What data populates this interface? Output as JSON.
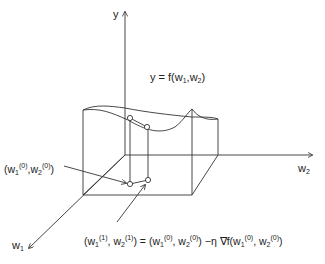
{
  "diagram": {
    "axes": {
      "y": {
        "label": "y"
      },
      "w2": {
        "label": "w",
        "sub": "2"
      },
      "w1": {
        "label": "w",
        "sub": "1"
      }
    },
    "surface_label": {
      "prefix": "y = f(w",
      "sub1": "1",
      "mid": ",w",
      "sub2": "2",
      "suffix": ")"
    },
    "start_point_label": {
      "open": "(w",
      "sub1": "1",
      "sup1": "(0)",
      "mid": ",w",
      "sub2": "2",
      "sup2": "(0)",
      "close": ")"
    },
    "update_rule": {
      "lhs_open": "(w",
      "lhs_sub1": "1",
      "lhs_sup1": "(1)",
      "lhs_mid": ", w",
      "lhs_sub2": "2",
      "lhs_sup2": "(1)",
      "eq": ") = (w",
      "r_sub1": "1",
      "r_sup1": "(0)",
      "r_mid": ", w",
      "r_sub2": "2",
      "r_sup2": "(0)",
      "grad": ") −η ∇f(w",
      "g_sub1": "1",
      "g_sup1": "(0)",
      "g_mid": ", w",
      "g_sub2": "2",
      "g_sup2": "(0)",
      "g_close": ")"
    },
    "colors": {
      "stroke": "#333333",
      "background": "#ffffff"
    }
  }
}
